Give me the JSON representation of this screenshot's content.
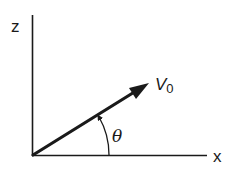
{
  "diagram": {
    "type": "vector-angle-diagram",
    "axes": {
      "vertical_label": "z",
      "horizontal_label": "x"
    },
    "vector": {
      "label_main": "V",
      "label_sub": "0"
    },
    "angle": {
      "label": "θ"
    },
    "colors": {
      "ink": "#1a1a1a",
      "background": "#ffffff"
    }
  }
}
